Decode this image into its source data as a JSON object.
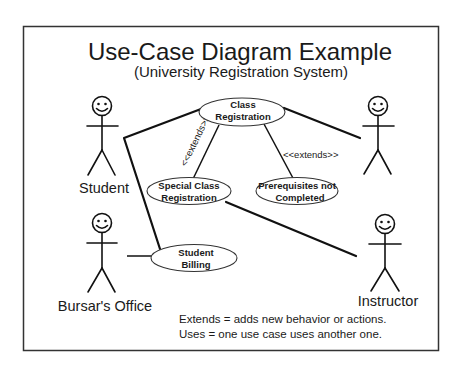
{
  "diagram": {
    "title": "Use-Case Diagram Example",
    "subtitle": "(University Registration System)",
    "actors": [
      {
        "id": "student",
        "label": "Student"
      },
      {
        "id": "unnamed-right",
        "label": ""
      },
      {
        "id": "bursars-office",
        "label": "Bursar's Office"
      },
      {
        "id": "instructor",
        "label": "Instructor"
      }
    ],
    "use_cases": [
      {
        "id": "class-registration",
        "line1": "Class",
        "line2": "Registration"
      },
      {
        "id": "special-class-registration",
        "line1": "Special Class",
        "line2": "Registration"
      },
      {
        "id": "prerequisites-not-completed",
        "line1": "Prerequisites not",
        "line2": "Completed"
      },
      {
        "id": "student-billing",
        "line1": "Student",
        "line2": "Billing"
      }
    ],
    "relationships": [
      {
        "from": "student",
        "to": "class-registration",
        "type": "association"
      },
      {
        "from": "student",
        "to": "student-billing",
        "type": "association"
      },
      {
        "from": "unnamed-right",
        "to": "class-registration",
        "type": "association"
      },
      {
        "from": "bursars-office",
        "to": "student-billing",
        "type": "association"
      },
      {
        "from": "instructor",
        "to": "special-class-registration",
        "type": "association"
      },
      {
        "from": "special-class-registration",
        "to": "class-registration",
        "type": "extends",
        "label": "<<extends>>"
      },
      {
        "from": "prerequisites-not-completed",
        "to": "class-registration",
        "type": "extends",
        "label": "<<extends>>"
      }
    ],
    "legend": {
      "line1": "Extends = adds new behavior or actions.",
      "line2": "Uses = one use case uses another one."
    }
  }
}
